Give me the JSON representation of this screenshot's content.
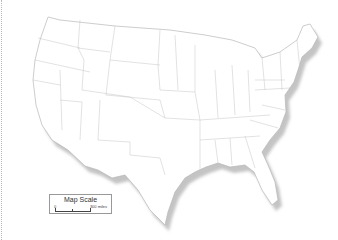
{
  "map": {
    "subject": "United States (contiguous) state outline map",
    "colors": {
      "fill": "#ffffff",
      "border": "#bdbdbd",
      "shadow": "#c8c8c8"
    }
  },
  "legend": {
    "title": "Map Scale",
    "zero_label": "0",
    "distance_label": "300 miles"
  }
}
